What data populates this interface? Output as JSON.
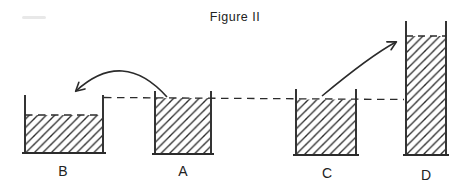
{
  "figure": {
    "title": "Figure II",
    "containers": [
      {
        "label": "B",
        "liquid_level": "low"
      },
      {
        "label": "A",
        "liquid_level": "reference"
      },
      {
        "label": "C",
        "liquid_level": "reference"
      },
      {
        "label": "D",
        "liquid_level": "high"
      }
    ],
    "flow_arrows": [
      {
        "from": "A",
        "to": "B"
      },
      {
        "from": "C",
        "to": "D"
      }
    ],
    "colors": {
      "ink": "#2b2b2b",
      "background": "#ffffff"
    }
  }
}
